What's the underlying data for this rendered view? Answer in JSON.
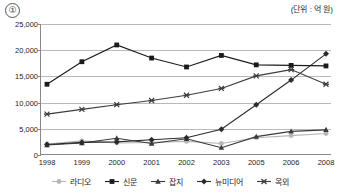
{
  "header": {
    "item_marker": "①",
    "unit_note": "(단위 : 억 원)"
  },
  "chart_data": {
    "type": "line",
    "title": "",
    "subtitle": "",
    "xlabel": "",
    "ylabel": "",
    "unit": "억 원",
    "grid": true,
    "legend_position": "bottom",
    "categories": [
      "1998",
      "1999",
      "2000",
      "2001",
      "2002",
      "2003",
      "2005",
      "2006",
      "2008"
    ],
    "ylim": [
      0,
      25000
    ],
    "yticks": [
      0,
      5000,
      10000,
      15000,
      20000,
      25000
    ],
    "ytick_labels": [
      "0",
      "5,000",
      "10,000",
      "15,000",
      "20,000",
      "25,000"
    ],
    "series": [
      {
        "name": "라디오",
        "marker": "circle",
        "color": "#b6b6b6",
        "values": [
          2100,
          2700,
          2300,
          2400,
          2600,
          2200,
          3300,
          3700,
          4100
        ]
      },
      {
        "name": "신문",
        "marker": "square",
        "color": "#1a1a1a",
        "values": [
          13500,
          17800,
          21000,
          18500,
          16800,
          19000,
          17200,
          17100,
          17000
        ]
      },
      {
        "name": "잡지",
        "marker": "triangle",
        "color": "#3a3a3a",
        "values": [
          1900,
          2300,
          3200,
          2200,
          3100,
          1400,
          3500,
          4500,
          4800
        ]
      },
      {
        "name": "뉴미디어",
        "marker": "diamond",
        "color": "#2b2b2b",
        "values": [
          2000,
          2400,
          2500,
          2900,
          3300,
          4900,
          9600,
          14300,
          19300
        ]
      },
      {
        "name": "옥외",
        "marker": "star",
        "color": "#3d3d3d",
        "values": [
          7800,
          8700,
          9600,
          10400,
          11400,
          12700,
          15100,
          16300,
          13500
        ]
      }
    ]
  }
}
